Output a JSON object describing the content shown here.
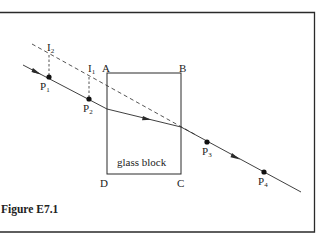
{
  "figure": {
    "caption": "Figure E7.1",
    "block_label": "glass block",
    "corners": {
      "A": "A",
      "B": "B",
      "C": "C",
      "D": "D"
    },
    "pins": [
      {
        "id": "P1",
        "letter": "P",
        "sub": "1"
      },
      {
        "id": "P2",
        "letter": "P",
        "sub": "2"
      },
      {
        "id": "P3",
        "letter": "P",
        "sub": "3"
      },
      {
        "id": "P4",
        "letter": "P",
        "sub": "4"
      }
    ],
    "images": [
      {
        "id": "I1",
        "letter": "I",
        "sub": "1"
      },
      {
        "id": "I2",
        "letter": "I",
        "sub": "2"
      }
    ]
  },
  "colors": {
    "line": "#2a2a2a",
    "background": "#ffffff"
  }
}
